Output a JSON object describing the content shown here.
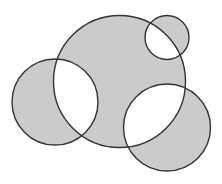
{
  "diagram": {
    "type": "overlapping-circles",
    "fill_rule": "evenodd",
    "colors": {
      "background": "#ffffff",
      "fill": "#cbcbcb",
      "stroke": "#333333"
    },
    "stroke_width": 1.4,
    "circles": [
      {
        "name": "large-center-circle",
        "cx": 119.5,
        "cy": 81.5,
        "r": 66
      },
      {
        "name": "small-top-right-circle",
        "cx": 167,
        "cy": 37.5,
        "r": 22
      },
      {
        "name": "left-circle",
        "cx": 55,
        "cy": 102,
        "r": 43
      },
      {
        "name": "bottom-right-circle",
        "cx": 167,
        "cy": 127.5,
        "r": 43.5
      }
    ]
  }
}
